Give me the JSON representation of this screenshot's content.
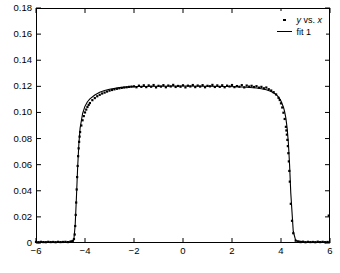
{
  "chart_data": {
    "type": "scatter",
    "title": "",
    "xlabel": "",
    "ylabel": "",
    "xlim": [
      -6,
      6
    ],
    "ylim": [
      0,
      0.18
    ],
    "grid": false,
    "legend_position": "top-right",
    "xticks": [
      -6,
      -4,
      -2,
      0,
      2,
      4,
      6
    ],
    "xtick_labels": [
      "−6",
      "−4",
      "−2",
      "0",
      "2",
      "4",
      "6"
    ],
    "yticks": [
      0,
      0.02,
      0.04,
      0.06,
      0.08,
      0.1,
      0.12,
      0.14,
      0.16,
      0.18
    ],
    "ytick_labels": [
      "0",
      "0.02",
      "0.04",
      "0.06",
      "0.08",
      "0.10",
      "0.12",
      "0.14",
      "0.16",
      "0.18"
    ],
    "series": [
      {
        "name": "y vs. x",
        "name_parts": {
          "y": "y",
          "vs": " vs. ",
          "x": "x"
        },
        "type": "scatter",
        "marker": "dot",
        "color": "#000000",
        "x": [
          -6.0,
          -5.9,
          -5.8,
          -5.7,
          -5.6,
          -5.5,
          -5.4,
          -5.3,
          -5.2,
          -5.1,
          -5.0,
          -4.9,
          -4.8,
          -4.7,
          -4.6,
          -4.55,
          -4.5,
          -4.45,
          -4.42,
          -4.4,
          -4.38,
          -4.36,
          -4.34,
          -4.32,
          -4.3,
          -4.28,
          -4.26,
          -4.24,
          -4.22,
          -4.2,
          -4.15,
          -4.1,
          -4.05,
          -4.0,
          -3.95,
          -3.9,
          -3.85,
          -3.8,
          -3.7,
          -3.6,
          -3.5,
          -3.4,
          -3.3,
          -3.2,
          -3.1,
          -3.0,
          -2.9,
          -2.8,
          -2.7,
          -2.6,
          -2.5,
          -2.4,
          -2.3,
          -2.2,
          -2.1,
          -2.0,
          -1.9,
          -1.8,
          -1.7,
          -1.6,
          -1.5,
          -1.4,
          -1.3,
          -1.2,
          -1.1,
          -1.0,
          -0.9,
          -0.8,
          -0.7,
          -0.6,
          -0.5,
          -0.4,
          -0.3,
          -0.2,
          -0.1,
          0.0,
          0.1,
          0.2,
          0.3,
          0.4,
          0.5,
          0.6,
          0.7,
          0.8,
          0.9,
          1.0,
          1.1,
          1.2,
          1.3,
          1.4,
          1.5,
          1.6,
          1.7,
          1.8,
          1.9,
          2.0,
          2.1,
          2.2,
          2.3,
          2.4,
          2.5,
          2.6,
          2.7,
          2.8,
          2.9,
          3.0,
          3.1,
          3.2,
          3.3,
          3.4,
          3.5,
          3.6,
          3.7,
          3.8,
          3.9,
          3.95,
          4.0,
          4.05,
          4.1,
          4.15,
          4.2,
          4.22,
          4.24,
          4.26,
          4.28,
          4.3,
          4.32,
          4.34,
          4.36,
          4.4,
          4.45,
          4.5,
          4.6,
          4.7,
          4.8,
          4.9,
          5.0,
          5.1,
          5.2,
          5.3,
          5.4,
          5.5,
          5.6,
          5.7,
          5.8,
          5.9,
          5.95
        ],
        "y": [
          0.0008,
          0.0006,
          0.0009,
          0.0007,
          0.0006,
          0.0009,
          0.0007,
          0.0008,
          0.0006,
          0.0009,
          0.0007,
          0.0008,
          0.0009,
          0.0007,
          0.001,
          0.0012,
          0.0016,
          0.003,
          0.0065,
          0.013,
          0.0215,
          0.031,
          0.041,
          0.0505,
          0.059,
          0.0665,
          0.0725,
          0.0775,
          0.0815,
          0.085,
          0.09,
          0.094,
          0.0972,
          0.1,
          0.1022,
          0.1042,
          0.1058,
          0.1072,
          0.1094,
          0.111,
          0.1124,
          0.1135,
          0.1145,
          0.1152,
          0.116,
          0.1167,
          0.1172,
          0.1177,
          0.1181,
          0.1185,
          0.1188,
          0.1191,
          0.1193,
          0.1196,
          0.1198,
          0.12,
          0.1193,
          0.1205,
          0.1196,
          0.1208,
          0.1194,
          0.1207,
          0.1197,
          0.121,
          0.1192,
          0.1204,
          0.1198,
          0.1209,
          0.1193,
          0.1206,
          0.1199,
          0.1211,
          0.1195,
          0.1203,
          0.1197,
          0.1208,
          0.1192,
          0.1205,
          0.1199,
          0.121,
          0.1194,
          0.1206,
          0.1198,
          0.1209,
          0.1193,
          0.1204,
          0.12,
          0.1211,
          0.1195,
          0.1207,
          0.1196,
          0.1208,
          0.1193,
          0.1205,
          0.1199,
          0.121,
          0.1194,
          0.1202,
          0.1197,
          0.1209,
          0.1192,
          0.1206,
          0.1198,
          0.1204,
          0.1195,
          0.1201,
          0.119,
          0.1196,
          0.1185,
          0.1191,
          0.1178,
          0.1168,
          0.1155,
          0.1138,
          0.1112,
          0.1095,
          0.107,
          0.1038,
          0.0998,
          0.095,
          0.089,
          0.0862,
          0.083,
          0.079,
          0.0742,
          0.0688,
          0.0625,
          0.0552,
          0.047,
          0.03,
          0.017,
          0.0075,
          0.0018,
          0.0009,
          0.0007,
          0.001,
          0.0006,
          0.0009,
          0.0007,
          0.0008,
          0.0006,
          0.001,
          0.0007,
          0.0009,
          0.0006,
          0.0008,
          0.021
        ]
      },
      {
        "name": "fit 1",
        "type": "line",
        "color": "#000000",
        "plateau": 0.12,
        "edge_left": -4.35,
        "edge_right": 4.3,
        "x": [
          -6.0,
          -5.0,
          -4.6,
          -4.5,
          -4.45,
          -4.4,
          -4.35,
          -4.3,
          -4.25,
          -4.2,
          -4.1,
          -4.0,
          -3.9,
          -3.8,
          -3.6,
          -3.4,
          -3.2,
          -3.0,
          -2.6,
          -2.2,
          -1.8,
          -1.0,
          0.0,
          1.0,
          1.8,
          2.2,
          2.6,
          3.0,
          3.2,
          3.4,
          3.6,
          3.8,
          3.9,
          4.0,
          4.1,
          4.15,
          4.2,
          4.25,
          4.3,
          4.35,
          4.4,
          4.5,
          4.6,
          5.0,
          6.0
        ],
        "y": [
          0.0007,
          0.0007,
          0.0009,
          0.0014,
          0.0035,
          0.014,
          0.035,
          0.058,
          0.076,
          0.088,
          0.099,
          0.1048,
          0.1082,
          0.1104,
          0.1134,
          0.1154,
          0.1168,
          0.1178,
          0.119,
          0.1196,
          0.1199,
          0.1201,
          0.1202,
          0.1201,
          0.1199,
          0.1197,
          0.1193,
          0.1187,
          0.1182,
          0.1174,
          0.116,
          0.1138,
          0.1118,
          0.1088,
          0.104,
          0.1005,
          0.0955,
          0.088,
          0.077,
          0.06,
          0.038,
          0.009,
          0.0018,
          0.0007,
          0.0007
        ]
      }
    ]
  },
  "legend": {
    "entries": [
      {
        "label": "y vs. x",
        "marker": "dot"
      },
      {
        "label": "fit 1",
        "marker": "line"
      }
    ],
    "fit_label": "fit 1",
    "vs_text": " vs. ",
    "y_symbol": "y",
    "x_symbol": "x"
  },
  "colors": {
    "foreground": "#000000",
    "background": "#ffffff"
  }
}
